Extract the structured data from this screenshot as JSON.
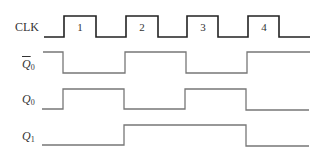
{
  "diagram": {
    "type": "timing-diagram",
    "signals": [
      {
        "id": "clk",
        "label": "CLK",
        "subscript": "",
        "overline": false,
        "italic": false
      },
      {
        "id": "q0bar",
        "label": "Q",
        "subscript": "0",
        "overline": true,
        "italic": true
      },
      {
        "id": "q0",
        "label": "Q",
        "subscript": "0",
        "overline": false,
        "italic": true
      },
      {
        "id": "q1",
        "label": "Q",
        "subscript": "1",
        "overline": false,
        "italic": true
      }
    ],
    "clock_pulses": [
      "1",
      "2",
      "3",
      "4"
    ],
    "colors": {
      "clk": "#222222",
      "outputs": "#777777"
    }
  }
}
